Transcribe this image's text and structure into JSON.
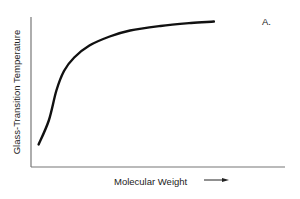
{
  "chart_data": {
    "type": "line",
    "title": "",
    "panel_label": "A.",
    "xlabel": "Molecular Weight",
    "ylabel": "Glass-Transition Temperature",
    "x_arrow": true,
    "grid": false,
    "legend": null,
    "ticks": false,
    "series": [
      {
        "name": "Tg vs molecular weight",
        "x": [
          0.03,
          0.07,
          0.1,
          0.13,
          0.17,
          0.23,
          0.31,
          0.39,
          0.51,
          0.63,
          0.72
        ],
        "y": [
          0.15,
          0.31,
          0.51,
          0.64,
          0.73,
          0.81,
          0.87,
          0.91,
          0.94,
          0.96,
          0.97
        ]
      }
    ],
    "xlim": [
      0,
      1
    ],
    "ylim": [
      0,
      1
    ],
    "colors": {
      "line": "#111111",
      "axis": "#777777"
    }
  }
}
